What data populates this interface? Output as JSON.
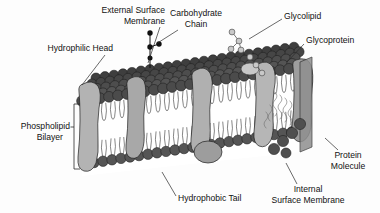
{
  "diagram": {
    "background_color": "#fdfdfd",
    "palette": {
      "phospholipid_head_dark": "#4b4b4b",
      "phospholipid_head_shadow": "#343434",
      "head_inner_leaflet": "#555555",
      "protein_light": "#b9b9b9",
      "protein_mid": "#9a9a9a",
      "protein_dark": "#7f7f7f",
      "carbohydrate_dot": "#111111",
      "glycolipid_dot": "#c3c3c3",
      "outline": "#1d1d1d",
      "label_text": "#111111",
      "leader_line": "#2a2a2a",
      "interior_fill": "#ffffff"
    }
  },
  "labels": [
    {
      "id": "external-surface-membrane",
      "lines": [
        "External Surface",
        "Membrane"
      ],
      "align": "end",
      "x": 165,
      "y": 11,
      "line_height": 11,
      "leader": "M 160 27 L 148 63"
    },
    {
      "id": "carbohydrate-chain",
      "lines": [
        "Carbohydrate",
        "Chain"
      ],
      "align": "middle",
      "x": 196,
      "y": 14,
      "line_height": 11,
      "leader": "M 178 30 L 156 44"
    },
    {
      "id": "glycolipid",
      "lines": [
        "Glycolipid"
      ],
      "align": "start",
      "x": 284,
      "y": 17,
      "line_height": 11,
      "leader": "M 282 19 L 249 39"
    },
    {
      "id": "glycoprotein",
      "lines": [
        "Glycoprotein"
      ],
      "align": "start",
      "x": 306,
      "y": 41,
      "line_height": 11,
      "leader": "M 304 44 L 287 62"
    },
    {
      "id": "hydrophilic-head",
      "lines": [
        "Hydrophilic Head"
      ],
      "align": "end",
      "x": 113,
      "y": 49,
      "line_height": 11,
      "leader": "M 105 55 L 82 85"
    },
    {
      "id": "phospholipid-bilayer",
      "lines": [
        "Phospholipid",
        "Bilayer"
      ],
      "align": "end",
      "x": 70,
      "y": 127,
      "line_height": 11,
      "leader": ""
    },
    {
      "id": "hydrophobic-tail",
      "lines": [
        "Hydrophobic Tail"
      ],
      "align": "start",
      "x": 178,
      "y": 199,
      "line_height": 11,
      "leader": "M 176 196 L 162 172"
    },
    {
      "id": "internal-surface-membrane",
      "lines": [
        "Internal",
        "Surface Membrane"
      ],
      "align": "middle",
      "x": 308,
      "y": 190,
      "line_height": 11,
      "leader": "M 297 184 L 286 163"
    },
    {
      "id": "protein-molecule",
      "lines": [
        "Protein",
        "Molecule"
      ],
      "align": "middle",
      "x": 348,
      "y": 156,
      "line_height": 11,
      "leader": "M 338 150 L 325 138"
    }
  ],
  "structures": {
    "bracket": {
      "name": "phospholipid-bilayer-bracket",
      "path": "M 80 104 L 74 104 L 74 169 L 80 169",
      "tick": "M 74 127 L 70.5 127"
    },
    "carbohydrate_chain": {
      "name": "carbohydrate-chain",
      "dots": [
        {
          "cx": 150,
          "cy": 33,
          "r": 2.6
        },
        {
          "cx": 159,
          "cy": 44,
          "r": 2.6
        },
        {
          "cx": 150,
          "cy": 47,
          "r": 2.6
        },
        {
          "cx": 150,
          "cy": 58,
          "r": 2.4
        }
      ],
      "stems": "M 150 33 L 150 68 M 150 47 L 159 44"
    },
    "glycolipid_chain": {
      "name": "glycolipid-chain",
      "dots": [
        {
          "cx": 232,
          "cy": 32,
          "r": 2.8
        },
        {
          "cx": 239,
          "cy": 41,
          "r": 2.8
        },
        {
          "cx": 231,
          "cy": 49,
          "r": 2.8
        },
        {
          "cx": 241,
          "cy": 50,
          "r": 2.8
        },
        {
          "cx": 250,
          "cy": 57,
          "r": 2.8
        },
        {
          "cx": 256,
          "cy": 65,
          "r": 2.8
        },
        {
          "cx": 262,
          "cy": 73,
          "r": 2.8
        }
      ],
      "stems": "M 232 32 L 239 41 L 231 49 M 239 41 L 241 50 L 250 57 L 256 65 L 262 73"
    },
    "membrane": {
      "top_face_rows": 5,
      "top_face_head_radius": 5.2,
      "outer_leaflet_heads": 22,
      "inner_leaflet_heads": 20,
      "transmembrane_proteins": 5,
      "peripheral_proteins": 2
    }
  }
}
